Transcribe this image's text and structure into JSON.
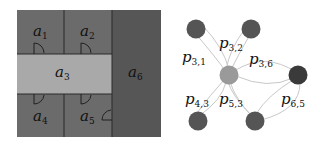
{
  "floorplan": {
    "colors": {
      "room": "#6b6b6b",
      "corridor": "#a9a9a9",
      "dark_room": "#555555",
      "wall": "#2a2a2a"
    },
    "rooms": [
      {
        "id": "a1",
        "base": "a",
        "sub": "1"
      },
      {
        "id": "a2",
        "base": "a",
        "sub": "2"
      },
      {
        "id": "a3",
        "base": "a",
        "sub": "3"
      },
      {
        "id": "a4",
        "base": "a",
        "sub": "4"
      },
      {
        "id": "a5",
        "base": "a",
        "sub": "5"
      },
      {
        "id": "a6",
        "base": "a",
        "sub": "6"
      }
    ]
  },
  "graph": {
    "colors": {
      "node": "#555555",
      "center_node": "#9a9a9a",
      "dark_node": "#3a3a3a",
      "edge": "#c8c8c8"
    },
    "edge_labels": [
      {
        "id": "p31",
        "base": "p",
        "sub": "3,1"
      },
      {
        "id": "p32",
        "base": "p",
        "sub": "3,2"
      },
      {
        "id": "p36",
        "base": "p",
        "sub": "3,6"
      },
      {
        "id": "p43",
        "base": "p",
        "sub": "4,3"
      },
      {
        "id": "p53",
        "base": "p",
        "sub": "5,3"
      },
      {
        "id": "p65",
        "base": "p",
        "sub": "6,5"
      }
    ]
  }
}
